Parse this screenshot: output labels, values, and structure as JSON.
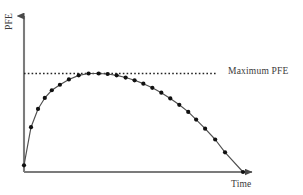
{
  "figure": {
    "background_color": "#ffffff",
    "axis_color": "#6e6e6e",
    "curve_color": "#555555",
    "marker_color": "#111111",
    "dashed_line_color": "#222222",
    "text_color": "#3a3a3a"
  },
  "labels": {
    "ylabel": "PFE",
    "xlabel": "Time",
    "max_annotation": "Maximum PFE"
  },
  "chart_data": {
    "type": "line",
    "title": "",
    "xlabel": "Time",
    "ylabel": "PFE",
    "grid": false,
    "legend": false,
    "xlim": [
      0,
      1
    ],
    "ylim": [
      0,
      1.12
    ],
    "annotations": [
      {
        "text": "Maximum PFE",
        "type": "horizontal-dashed-line",
        "y": 1.0,
        "x_start": 0.0,
        "x_end": 0.875,
        "label_x": 0.93
      }
    ],
    "series": [
      {
        "name": "PFE profile",
        "marker": "filled-circle",
        "x": [
          0.0,
          0.032,
          0.064,
          0.095,
          0.127,
          0.164,
          0.205,
          0.25,
          0.295,
          0.341,
          0.382,
          0.423,
          0.464,
          0.505,
          0.545,
          0.586,
          0.627,
          0.668,
          0.709,
          0.75,
          0.786,
          0.827,
          0.873,
          0.918,
          1.0
        ],
        "y": [
          0.068,
          0.455,
          0.64,
          0.752,
          0.83,
          0.886,
          0.94,
          0.981,
          1.0,
          1.0,
          0.995,
          0.981,
          0.959,
          0.931,
          0.897,
          0.855,
          0.805,
          0.747,
          0.682,
          0.61,
          0.532,
          0.44,
          0.33,
          0.2,
          0.0
        ]
      }
    ]
  }
}
